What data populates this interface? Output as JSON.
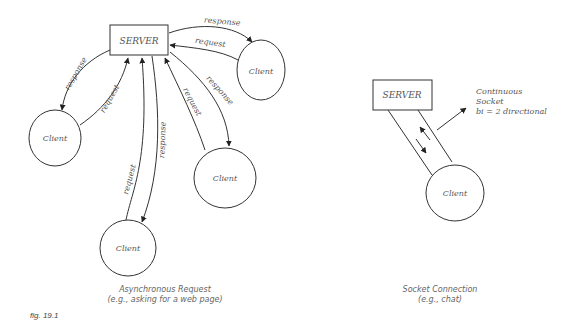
{
  "figure_label": "fig. 19.1",
  "async_diagram": {
    "server_label": "SERVER",
    "client_label": "Client",
    "caption_line1": "Asynchronous Request",
    "caption_line2": "(e.g., asking for a web page)",
    "arrow_labels": {
      "right_response": "response",
      "right_request": "request",
      "left_response": "response",
      "left_request": "request",
      "bottom_request": "request",
      "bottom_response": "response",
      "lowright_request": "request",
      "lowright_response": "response"
    }
  },
  "socket_diagram": {
    "server_label": "SERVER",
    "client_label": "Client",
    "note_line1": "Continuous",
    "note_line2": "Socket",
    "note_line3": "bi = 2 directional",
    "caption_line1": "Socket Connection",
    "caption_line2": "(e.g., chat)"
  }
}
